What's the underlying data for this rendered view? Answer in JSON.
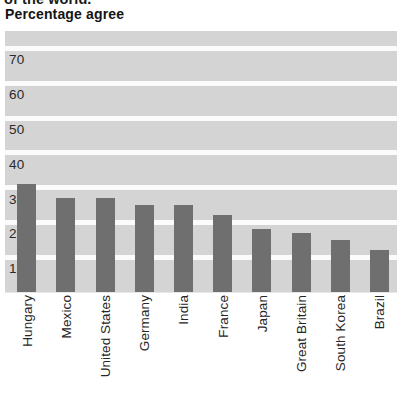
{
  "headline": {
    "clipped_text": "of the world."
  },
  "subtitle": "Percentage agree",
  "colors": {
    "bar": "#6f6f6f",
    "plot_background": "#d4d4d4",
    "gridline": "#fbfbfb",
    "text": "#262626"
  },
  "chart_data": {
    "type": "bar",
    "title": "Percentage agree",
    "xlabel": "",
    "ylabel": "",
    "ylim": [
      0,
      75
    ],
    "ytick_labels": [
      "70",
      "60",
      "50",
      "40",
      "30",
      "20",
      "10"
    ],
    "ytick_values": [
      70,
      60,
      50,
      40,
      30,
      20,
      10
    ],
    "grid": true,
    "legend": "none",
    "categories": [
      "Hungary",
      "Mexico",
      "United States",
      "Germany",
      "India",
      "France",
      "Japan",
      "Great Britain",
      "South Korea",
      "Brazil"
    ],
    "values": [
      31,
      27,
      27,
      25,
      25,
      22,
      18,
      17,
      15,
      12
    ]
  }
}
